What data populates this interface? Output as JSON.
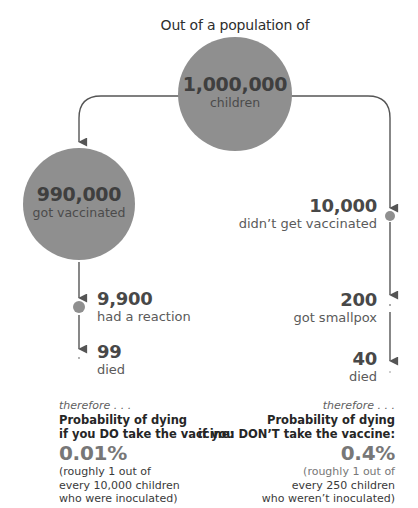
{
  "header": {
    "title": "Out of a population of"
  },
  "root": {
    "count": "1,000,000",
    "label": "children"
  },
  "vaccinated": {
    "count": "990,000",
    "label": "got vaccinated",
    "reaction": {
      "count": "9,900",
      "label": "had a reaction"
    },
    "died": {
      "count": "99",
      "label": "died"
    },
    "conclusion": {
      "lead": "therefore . . .",
      "prob_line1": "Probability of dying",
      "prob_line2": "if you DO take the vaccine:",
      "percent": "0.01%",
      "note_line1": "(roughly 1 out of",
      "note_line2": "every 10,000 children",
      "note_line3": "who were inoculated)"
    }
  },
  "unvaccinated": {
    "count": "10,000",
    "label": "didn’t get vaccinated",
    "smallpox": {
      "count": "200",
      "label": "got smallpox"
    },
    "died": {
      "count": "40",
      "label": "died"
    },
    "conclusion": {
      "lead": "therefore . . .",
      "prob_line1": "Probability of dying",
      "prob_line2": "if you DON’T take the vaccine:",
      "percent": "0.4%",
      "note_line1": "(roughly 1 out of",
      "note_line2": "every 250 children",
      "note_line3": "who weren’t inoculated)"
    }
  },
  "colors": {
    "circle_fill": "#8f8f8f",
    "line": "#555555",
    "number_text": "#484848",
    "percent_text": "#777777"
  }
}
